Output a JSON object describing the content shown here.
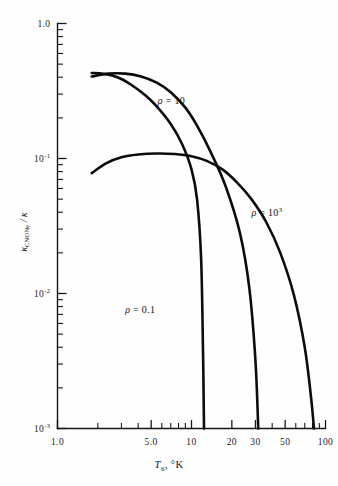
{
  "chart_data": {
    "type": "line",
    "title": "",
    "xlabel": "T₆, °K",
    "xlabel_parts": {
      "symbol": "T",
      "subscript": "6",
      "suffix": ", °K"
    },
    "ylabel": "κ_CNONe / κ",
    "ylabel_parts": {
      "symbol": "κ",
      "subscript": "CNONe",
      "divider": "/",
      "denominator": "κ"
    },
    "xscale": "log",
    "yscale": "log",
    "xlim": [
      1.0,
      100
    ],
    "ylim": [
      0.001,
      1.0
    ],
    "grid": false,
    "legend": "inline-curve-labels",
    "xticks": [
      {
        "value": 1.0,
        "label": "1.0",
        "major": true
      },
      {
        "value": 2,
        "label": "",
        "major": false
      },
      {
        "value": 3,
        "label": "",
        "major": false
      },
      {
        "value": 4,
        "label": "",
        "major": false
      },
      {
        "value": 5.0,
        "label": "5.0",
        "major": true
      },
      {
        "value": 6,
        "label": "",
        "major": false
      },
      {
        "value": 7,
        "label": "",
        "major": false
      },
      {
        "value": 8,
        "label": "",
        "major": false
      },
      {
        "value": 9,
        "label": "",
        "major": false
      },
      {
        "value": 10,
        "label": "10",
        "major": true
      },
      {
        "value": 20,
        "label": "20",
        "major": true
      },
      {
        "value": 30,
        "label": "30",
        "major": true
      },
      {
        "value": 40,
        "label": "",
        "major": false
      },
      {
        "value": 50,
        "label": "50",
        "major": true
      },
      {
        "value": 60,
        "label": "",
        "major": false
      },
      {
        "value": 70,
        "label": "",
        "major": false
      },
      {
        "value": 80,
        "label": "",
        "major": false
      },
      {
        "value": 90,
        "label": "",
        "major": false
      },
      {
        "value": 100,
        "label": "100",
        "major": true
      }
    ],
    "yticks": [
      {
        "value": 1.0,
        "label": "1.0",
        "sup": "",
        "major": true
      },
      {
        "value": 0.1,
        "label": "10",
        "sup": "-1",
        "major": true
      },
      {
        "value": 0.01,
        "label": "10",
        "sup": "-2",
        "major": true
      },
      {
        "value": 0.001,
        "label": "10",
        "sup": "-3",
        "major": true
      }
    ],
    "series": [
      {
        "name": "rho-0.1",
        "label": "ρ = 0.1",
        "label_base": "ρ = 0.1",
        "label_sup": "",
        "points": [
          [
            1.8,
            0.43
          ],
          [
            2.2,
            0.425
          ],
          [
            2.8,
            0.4
          ],
          [
            3.5,
            0.355
          ],
          [
            4.5,
            0.295
          ],
          [
            5.5,
            0.243
          ],
          [
            7.0,
            0.18
          ],
          [
            8.5,
            0.128
          ],
          [
            10.0,
            0.083
          ],
          [
            11.0,
            0.05
          ],
          [
            11.8,
            0.018
          ],
          [
            12.2,
            0.0035
          ],
          [
            12.4,
            0.001
          ]
        ]
      },
      {
        "name": "rho-10",
        "label": "ρ = 10",
        "label_base": "ρ = 10",
        "label_sup": "",
        "points": [
          [
            1.8,
            0.405
          ],
          [
            2.4,
            0.425
          ],
          [
            3.2,
            0.425
          ],
          [
            4.2,
            0.405
          ],
          [
            5.5,
            0.365
          ],
          [
            7.0,
            0.31
          ],
          [
            9.0,
            0.238
          ],
          [
            11.0,
            0.175
          ],
          [
            14.0,
            0.11
          ],
          [
            18.0,
            0.062
          ],
          [
            23.0,
            0.028
          ],
          [
            27.0,
            0.011
          ],
          [
            30.0,
            0.0032
          ],
          [
            31.5,
            0.001
          ]
        ]
      },
      {
        "name": "rho-1e3",
        "label": "ρ = 10³",
        "label_base": "ρ = 10",
        "label_sup": "3",
        "points": [
          [
            1.8,
            0.078
          ],
          [
            2.3,
            0.092
          ],
          [
            3.0,
            0.102
          ],
          [
            4.0,
            0.107
          ],
          [
            5.5,
            0.109
          ],
          [
            7.5,
            0.108
          ],
          [
            10.0,
            0.104
          ],
          [
            13.0,
            0.096
          ],
          [
            17.0,
            0.083
          ],
          [
            22.0,
            0.066
          ],
          [
            28.0,
            0.05
          ],
          [
            36.0,
            0.034
          ],
          [
            46.0,
            0.02
          ],
          [
            58.0,
            0.0098
          ],
          [
            70.0,
            0.004
          ],
          [
            78.0,
            0.0017
          ],
          [
            82.0,
            0.001
          ]
        ]
      }
    ],
    "curve_label_positions": [
      {
        "series": "rho-0.1",
        "x": 3.2,
        "y": 0.0072
      },
      {
        "series": "rho-10",
        "x": 5.6,
        "y": 0.255
      },
      {
        "series": "rho-1e3",
        "x": 28.0,
        "y": 0.0375
      }
    ]
  }
}
